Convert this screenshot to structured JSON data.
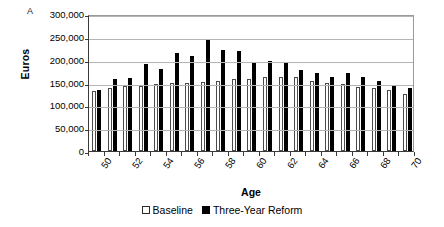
{
  "panel": {
    "letter": "A"
  },
  "chart_data": {
    "type": "bar",
    "title": "",
    "xlabel": "Age",
    "ylabel": "Euros",
    "ylim": [
      0,
      300000
    ],
    "ytick_step": 50000,
    "ytick_labels": [
      "300,000",
      "250,000",
      "200,000",
      "150,000",
      "100,000",
      "50,000",
      "0"
    ],
    "ytick_values": [
      300000,
      250000,
      200000,
      150000,
      100000,
      50000,
      0
    ],
    "grid": true,
    "legend_position": "bottom-center",
    "categories": [
      50,
      51,
      52,
      53,
      54,
      55,
      56,
      57,
      58,
      59,
      60,
      61,
      62,
      63,
      64,
      65,
      66,
      67,
      68,
      69,
      70
    ],
    "xtick_labels": [
      "50",
      "52",
      "54",
      "56",
      "58",
      "60",
      "62",
      "64",
      "66",
      "68",
      "70"
    ],
    "series": [
      {
        "name": "Baseline",
        "color": "#ffffff",
        "edgecolor": "#4a4a4a",
        "values": [
          131000,
          138000,
          143000,
          143000,
          146000,
          148000,
          150000,
          152000,
          154000,
          157000,
          158000,
          161000,
          163000,
          161000,
          154000,
          150000,
          147000,
          141000,
          138000,
          133000,
          125000
        ]
      },
      {
        "name": "Three-Year Reform",
        "color": "#000000",
        "edgecolor": "#000000",
        "values": [
          134000,
          157000,
          159000,
          191000,
          179000,
          214000,
          207000,
          243000,
          222000,
          218000,
          196000,
          197000,
          192000,
          178000,
          170000,
          163000,
          171000,
          163000,
          153000,
          143000,
          138000
        ]
      }
    ]
  },
  "legend": {
    "items": [
      {
        "label": "Baseline",
        "marker": "open-square-icon"
      },
      {
        "label": "Three-Year Reform",
        "marker": "filled-square-icon"
      }
    ]
  }
}
